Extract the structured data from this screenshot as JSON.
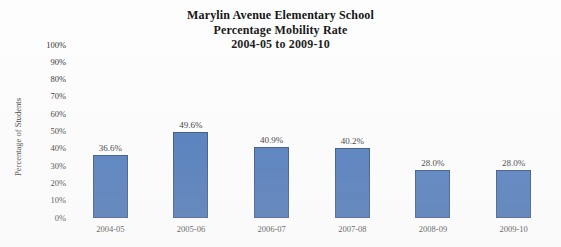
{
  "chart_data": {
    "type": "bar",
    "title": "Marylin Avenue Elementary School Percentage Mobility Rate 2004-05 to 2009-10",
    "title_lines": [
      "Marylin Avenue Elementary School",
      "Percentage Mobility Rate",
      "2004-05 to 2009-10"
    ],
    "xlabel": "",
    "ylabel": "Percentage of Students",
    "ylim": [
      0,
      100
    ],
    "ytick_labels": [
      "100%",
      "90%",
      "80%",
      "70%",
      "60%",
      "50%",
      "40%",
      "30%",
      "20%",
      "10%",
      "0%"
    ],
    "ytick_values": [
      100,
      90,
      80,
      70,
      60,
      50,
      40,
      30,
      20,
      10,
      0
    ],
    "grid": false,
    "legend": false,
    "legend_position": "none",
    "bar_color": "#2b5fae",
    "bar_border_color": "#1b3c70",
    "categories": [
      "2004-05",
      "2005-06",
      "2006-07",
      "2007-08",
      "2008-09",
      "2009-10"
    ],
    "values": [
      36.6,
      49.6,
      40.9,
      40.2,
      28.0,
      28.0
    ],
    "data_labels": [
      "36.6%",
      "49.6%",
      "40.9%",
      "40.2%",
      "28.0%",
      "28.0%"
    ],
    "points": [
      {
        "category": "2004-05",
        "value": 36.6,
        "label": "36.6%"
      },
      {
        "category": "2005-06",
        "value": 49.6,
        "label": "49.6%"
      },
      {
        "category": "2006-07",
        "value": 40.9,
        "label": "40.9%"
      },
      {
        "category": "2007-08",
        "value": 40.2,
        "label": "40.2%"
      },
      {
        "category": "2008-09",
        "value": 28.0,
        "label": "28.0%"
      },
      {
        "category": "2009-10",
        "value": 28.0,
        "label": "28.0%"
      }
    ]
  }
}
